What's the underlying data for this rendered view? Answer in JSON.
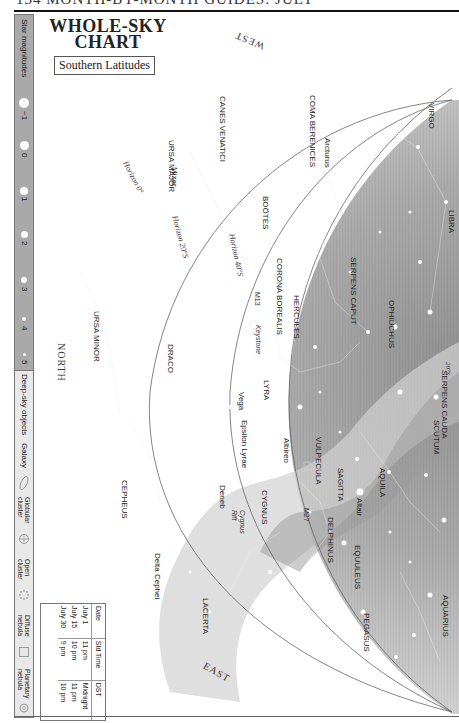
{
  "page": {
    "header_text": "134   MONTH-BY-MONTH GUIDES: JULY"
  },
  "title": {
    "line1": "WHOLE-SKY",
    "line2": "CHART",
    "subtitle": "Southern Latitudes"
  },
  "sidebar": {
    "magnitudes_title": "Star magnitudes",
    "magnitudes": [
      {
        "label": "−1",
        "size": 9
      },
      {
        "label": "0",
        "size": 8
      },
      {
        "label": "1",
        "size": 7
      },
      {
        "label": "2",
        "size": 6
      },
      {
        "label": "3",
        "size": 5
      },
      {
        "label": "4",
        "size": 3.5
      },
      {
        "label": "5",
        "size": 2.5
      }
    ],
    "deep_sky_title": "Deep-sky objects",
    "deep_sky": [
      {
        "label": "Galaxy",
        "icon": "galaxy-icon"
      },
      {
        "label": "Globular cluster",
        "icon": "globular-cluster-icon"
      },
      {
        "label": "Open cluster",
        "icon": "open-cluster-icon"
      },
      {
        "label": "Diffuse nebula",
        "icon": "diffuse-nebula-icon"
      },
      {
        "label": "Planetary nebula",
        "icon": "planetary-nebula-icon"
      }
    ]
  },
  "directions": {
    "west": "WEST",
    "north": "NORTH",
    "east": "EAST"
  },
  "horizons": {
    "h0": "Horizon 0°",
    "h20": "Horizon 20°S",
    "h40": "Horizon 40°S"
  },
  "constellations": {
    "canes_venatici": "CANES VENATICI",
    "coma_berenices": "COMA BERENICES",
    "virgo": "VIRGO",
    "ursa_major": "URSA MAJOR",
    "bootes": "BOÖTES",
    "libra": "LIBRA",
    "corona_borealis": "CORONA BOREALIS",
    "serpens_caput": "SERPENS CAPUT",
    "hercules": "HERCULES",
    "ophiuchus": "OPHIUCHUS",
    "ursa_minor": "URSA MINOR",
    "draco": "DRACO",
    "lyra": "LYRA",
    "serpens_cauda": "SERPENS CAUDA",
    "scutum": "SCUTUM",
    "vulpecula": "VULPECULA",
    "sagitta": "SAGITTA",
    "aquila": "AQUILA",
    "cygnus": "CYGNUS",
    "delphinus": "DELPHINUS",
    "equuleus": "EQUULEUS",
    "cepheus": "CEPHEUS",
    "lacerta": "LACERTA",
    "pegasus": "PEGASUS",
    "aquarius": "AQUARIUS"
  },
  "stars": {
    "mizar": "Mizar",
    "arcturus": "Arcturus",
    "vega": "Vega",
    "epsilon_lyrae": "Epsilon Lyrae",
    "albireo": "Albireo",
    "altair": "Altair",
    "deneb": "Deneb",
    "delta_cephei": "Delta Cephei"
  },
  "deep_sky_labels": {
    "m13": "M13",
    "keystone": "Keystone",
    "m27": "M27",
    "cygnus_rift": "Cygnus Rift",
    "ecliptic_mark": "20°S"
  },
  "time_table": {
    "headers": [
      "Date",
      "Std Time",
      "DST"
    ],
    "rows": [
      [
        "July 1",
        "11 pm",
        "Midnight"
      ],
      [
        "July 15",
        "10 pm",
        "11 pm"
      ],
      [
        "July 30",
        "9 pm",
        "10 pm"
      ]
    ]
  },
  "colors": {
    "sky_outer": "#e6e6e6",
    "sky_inner": "#a8a8a8",
    "milky_way": "#c9c9c9",
    "horizon_line": "#666666",
    "sidebar_mag_bg": "#a9a9a9"
  }
}
